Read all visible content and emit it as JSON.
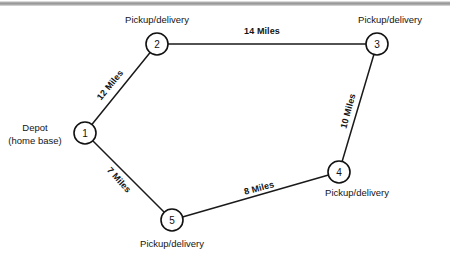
{
  "diagram": {
    "type": "network-graph",
    "background_color": "#ffffff",
    "line_color": "#1a1a1a",
    "text_color": "#141414",
    "nodes": [
      {
        "id": "1",
        "number": "1",
        "x": 85,
        "y": 133,
        "r": 11,
        "label_lines": [
          "Depot",
          "(home base)"
        ],
        "label_line1": "Depot",
        "label_line2": "(home base)",
        "label_x": 35,
        "label_y": 133,
        "role": "depot"
      },
      {
        "id": "2",
        "number": "2",
        "x": 157,
        "y": 44,
        "r": 11,
        "label_lines": [
          "Pickup/delivery"
        ],
        "label_line1": "Pickup/delivery",
        "label_x": 157,
        "label_y": 19,
        "role": "stop"
      },
      {
        "id": "3",
        "number": "3",
        "x": 377,
        "y": 44,
        "r": 11,
        "label_lines": [
          "Pickup/delivery"
        ],
        "label_line1": "Pickup/delivery",
        "label_x": 390,
        "label_y": 19,
        "role": "stop"
      },
      {
        "id": "4",
        "number": "4",
        "x": 339,
        "y": 172,
        "r": 11,
        "label_lines": [
          "Pickup/delivery"
        ],
        "label_line1": "Pickup/delivery",
        "label_x": 357,
        "label_y": 192,
        "role": "stop"
      },
      {
        "id": "5",
        "number": "5",
        "x": 172,
        "y": 220,
        "r": 11,
        "label_lines": [
          "Pickup/delivery"
        ],
        "label_line1": "Pickup/delivery",
        "label_x": 172,
        "label_y": 243,
        "role": "stop"
      }
    ],
    "edges": [
      {
        "id": "edge-1-2",
        "from": "1",
        "to": "2",
        "distance_value": 12,
        "distance_unit": "Miles",
        "label": "12 Miles",
        "label_x": 110,
        "label_y": 85,
        "label_rotation": -51
      },
      {
        "id": "edge-2-3",
        "from": "2",
        "to": "3",
        "distance_value": 14,
        "distance_unit": "Miles",
        "label": "14 Miles",
        "label_x": 262,
        "label_y": 31,
        "label_rotation": 0
      },
      {
        "id": "edge-3-4",
        "from": "3",
        "to": "4",
        "distance_value": 10,
        "distance_unit": "Miles",
        "label": "10 Miles",
        "label_x": 348,
        "label_y": 111,
        "label_rotation": -75
      },
      {
        "id": "edge-1-5",
        "from": "1",
        "to": "5",
        "distance_value": 7,
        "distance_unit": "Miles",
        "label": "7 Miles",
        "label_x": 119,
        "label_y": 180,
        "label_rotation": 48
      },
      {
        "id": "edge-5-4",
        "from": "5",
        "to": "4",
        "distance_value": 8,
        "distance_unit": "Miles",
        "label": "8 Miles",
        "label_x": 259,
        "label_y": 188,
        "label_rotation": -15
      }
    ]
  }
}
